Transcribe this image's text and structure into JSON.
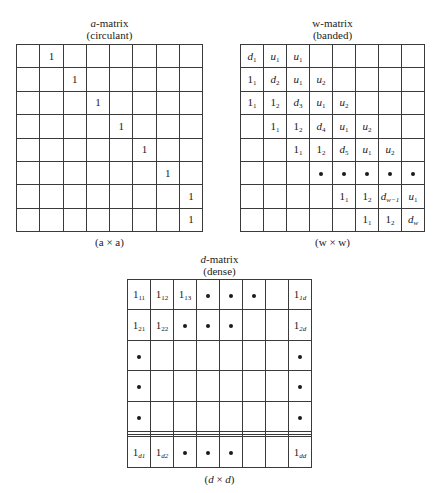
{
  "a_matrix": {
    "title_var": "a",
    "title_rest": "-matrix",
    "subtitle": "(circulant)",
    "caption": "(a × a)",
    "rows": 8,
    "cols": 8,
    "cells": [
      [
        {
          "t": ""
        },
        {
          "t": "1"
        },
        {
          "t": ""
        },
        {
          "t": ""
        },
        {
          "t": ""
        },
        {
          "t": ""
        },
        {
          "t": ""
        },
        {
          "t": ""
        }
      ],
      [
        {
          "t": ""
        },
        {
          "t": ""
        },
        {
          "t": "1"
        },
        {
          "t": ""
        },
        {
          "t": ""
        },
        {
          "t": ""
        },
        {
          "t": ""
        },
        {
          "t": ""
        }
      ],
      [
        {
          "t": ""
        },
        {
          "t": ""
        },
        {
          "t": ""
        },
        {
          "t": "1"
        },
        {
          "t": ""
        },
        {
          "t": ""
        },
        {
          "t": ""
        },
        {
          "t": ""
        }
      ],
      [
        {
          "t": ""
        },
        {
          "t": ""
        },
        {
          "t": ""
        },
        {
          "t": ""
        },
        {
          "t": "1"
        },
        {
          "t": ""
        },
        {
          "t": ""
        },
        {
          "t": ""
        }
      ],
      [
        {
          "t": ""
        },
        {
          "t": ""
        },
        {
          "t": ""
        },
        {
          "t": ""
        },
        {
          "t": ""
        },
        {
          "t": "1"
        },
        {
          "t": ""
        },
        {
          "t": ""
        }
      ],
      [
        {
          "t": ""
        },
        {
          "t": ""
        },
        {
          "t": ""
        },
        {
          "t": ""
        },
        {
          "t": ""
        },
        {
          "t": ""
        },
        {
          "t": "1"
        },
        {
          "t": ""
        }
      ],
      [
        {
          "t": ""
        },
        {
          "t": ""
        },
        {
          "t": ""
        },
        {
          "t": ""
        },
        {
          "t": ""
        },
        {
          "t": ""
        },
        {
          "t": ""
        },
        {
          "t": "1"
        }
      ],
      [
        {
          "t": ""
        },
        {
          "t": ""
        },
        {
          "t": ""
        },
        {
          "t": ""
        },
        {
          "t": ""
        },
        {
          "t": ""
        },
        {
          "t": ""
        },
        {
          "t": "1"
        }
      ]
    ]
  },
  "w_matrix": {
    "title_var": "w",
    "title_rest": "-matrix",
    "subtitle": "(banded)",
    "caption": "(w × w)",
    "rows": 8,
    "cols": 8,
    "cells": [
      [
        {
          "b": "d",
          "s": "1",
          "i": true
        },
        {
          "b": "u",
          "s": "1",
          "i": true
        },
        {
          "b": "u",
          "s": "1",
          "i": true
        },
        {
          "t": ""
        },
        {
          "t": ""
        },
        {
          "t": ""
        },
        {
          "t": ""
        },
        {
          "t": ""
        }
      ],
      [
        {
          "b": "1",
          "s": "1"
        },
        {
          "b": "d",
          "s": "2",
          "i": true
        },
        {
          "b": "u",
          "s": "1",
          "i": true
        },
        {
          "b": "u",
          "s": "2",
          "i": true
        },
        {
          "t": ""
        },
        {
          "t": ""
        },
        {
          "t": ""
        },
        {
          "t": ""
        }
      ],
      [
        {
          "b": "1",
          "s": "1"
        },
        {
          "b": "1",
          "s": "2"
        },
        {
          "b": "d",
          "s": "3",
          "i": true
        },
        {
          "b": "u",
          "s": "1",
          "i": true
        },
        {
          "b": "u",
          "s": "2",
          "i": true
        },
        {
          "t": ""
        },
        {
          "t": ""
        },
        {
          "t": ""
        }
      ],
      [
        {
          "t": ""
        },
        {
          "b": "1",
          "s": "1"
        },
        {
          "b": "1",
          "s": "2"
        },
        {
          "b": "d",
          "s": "4",
          "i": true
        },
        {
          "b": "u",
          "s": "1",
          "i": true
        },
        {
          "b": "u",
          "s": "2",
          "i": true
        },
        {
          "t": ""
        },
        {
          "t": ""
        }
      ],
      [
        {
          "t": ""
        },
        {
          "t": ""
        },
        {
          "b": "1",
          "s": "1"
        },
        {
          "b": "1",
          "s": "2"
        },
        {
          "b": "d",
          "s": "5",
          "i": true
        },
        {
          "b": "u",
          "s": "1",
          "i": true
        },
        {
          "b": "u",
          "s": "2",
          "i": true
        },
        {
          "t": ""
        }
      ],
      [
        {
          "t": ""
        },
        {
          "t": ""
        },
        {
          "t": ""
        },
        {
          "dot": true
        },
        {
          "dot": true
        },
        {
          "dot": true
        },
        {
          "dot": true
        },
        {
          "dot": true
        }
      ],
      [
        {
          "t": ""
        },
        {
          "t": ""
        },
        {
          "t": ""
        },
        {
          "t": ""
        },
        {
          "b": "1",
          "s": "1"
        },
        {
          "b": "1",
          "s": "2"
        },
        {
          "b": "d",
          "s": "w−1",
          "i": true,
          "si": true
        },
        {
          "b": "u",
          "s": "1",
          "i": true
        }
      ],
      [
        {
          "t": ""
        },
        {
          "t": ""
        },
        {
          "t": ""
        },
        {
          "t": ""
        },
        {
          "t": ""
        },
        {
          "b": "1",
          "s": "1"
        },
        {
          "b": "1",
          "s": "2"
        },
        {
          "b": "d",
          "s": "w",
          "i": true,
          "si": true
        }
      ]
    ]
  },
  "d_matrix": {
    "title_var": "d",
    "title_rest": "-matrix",
    "subtitle": "(dense)",
    "caption_open": "(",
    "caption_var1": "d",
    "caption_times": " × ",
    "caption_var2": "d",
    "caption_close": ")",
    "rows": 8,
    "cols": 8,
    "cells": [
      [
        {
          "b": "1",
          "s": "11"
        },
        {
          "b": "1",
          "s": "12"
        },
        {
          "b": "1",
          "s": "13"
        },
        {
          "dot": true
        },
        {
          "dot": true
        },
        {
          "dot": true
        },
        {
          "t": ""
        },
        {
          "b": "1",
          "s": "1d",
          "si": true
        }
      ],
      [
        {
          "b": "1",
          "s": "21"
        },
        {
          "b": "1",
          "s": "22"
        },
        {
          "dot": true
        },
        {
          "dot": true
        },
        {
          "dot": true
        },
        {
          "t": ""
        },
        {
          "t": ""
        },
        {
          "b": "1",
          "s": "2d",
          "si": true
        }
      ],
      [
        {
          "dot": true
        },
        {
          "t": ""
        },
        {
          "t": ""
        },
        {
          "t": ""
        },
        {
          "t": ""
        },
        {
          "t": ""
        },
        {
          "t": ""
        },
        {
          "dot": true
        }
      ],
      [
        {
          "dot": true
        },
        {
          "t": ""
        },
        {
          "t": ""
        },
        {
          "t": ""
        },
        {
          "t": ""
        },
        {
          "t": ""
        },
        {
          "t": ""
        },
        {
          "dot": true
        }
      ],
      [
        {
          "dot": true
        },
        {
          "t": ""
        },
        {
          "t": ""
        },
        {
          "t": ""
        },
        {
          "t": ""
        },
        {
          "t": ""
        },
        {
          "t": ""
        },
        {
          "dot": true
        }
      ],
      [
        {
          "t": ""
        },
        {
          "t": ""
        },
        {
          "t": ""
        },
        {
          "t": ""
        },
        {
          "t": ""
        },
        {
          "t": ""
        },
        {
          "t": ""
        },
        {
          "t": ""
        }
      ],
      [
        {
          "t": ""
        },
        {
          "t": ""
        },
        {
          "t": ""
        },
        {
          "t": ""
        },
        {
          "t": ""
        },
        {
          "t": ""
        },
        {
          "t": ""
        },
        {
          "t": ""
        }
      ],
      [
        {
          "b": "1",
          "s": "d1",
          "si": true
        },
        {
          "b": "1",
          "s": "d2",
          "si": true
        },
        {
          "dot": true
        },
        {
          "dot": true
        },
        {
          "dot": true
        },
        {
          "t": ""
        },
        {
          "t": ""
        },
        {
          "b": "1",
          "s": "dd",
          "si": true
        }
      ]
    ]
  }
}
